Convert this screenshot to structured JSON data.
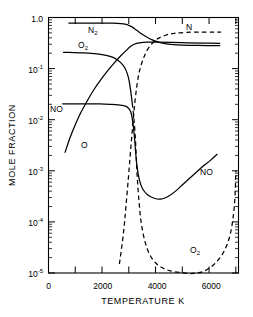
{
  "chart_data": {
    "type": "line",
    "title": "",
    "xlabel": "TEMPERATURE K",
    "ylabel": "MOLE FRACTION",
    "xlim": [
      0,
      7100
    ],
    "ylim": [
      1e-05,
      1.0
    ],
    "yscale": "log",
    "xscale": "linear",
    "grid": false,
    "legend": "inline-curve-labels",
    "xticks": [
      0,
      1000,
      2000,
      3000,
      4000,
      5000,
      6000,
      7000
    ],
    "xticklabels": [
      "0",
      "",
      "2000",
      "",
      "4000",
      "",
      "6000",
      ""
    ],
    "yticks": [
      1.0,
      0.1,
      0.01,
      0.001,
      0.0001,
      1e-05
    ],
    "yticklabels": [
      "1.0",
      "10-1",
      "10-2",
      "10-3",
      "10-4",
      "10-5"
    ],
    "series": [
      {
        "name": "N2",
        "label": "N2",
        "style": "solid",
        "label_x": 1450,
        "label_y": 0.55,
        "points": [
          [
            760,
            0.78
          ],
          [
            1200,
            0.78
          ],
          [
            1700,
            0.78
          ],
          [
            2100,
            0.778
          ],
          [
            2400,
            0.772
          ],
          [
            2700,
            0.757
          ],
          [
            2900,
            0.73
          ],
          [
            3000,
            0.7
          ],
          [
            3150,
            0.64
          ],
          [
            3300,
            0.56
          ],
          [
            3500,
            0.47
          ],
          [
            3700,
            0.405
          ],
          [
            3900,
            0.36
          ],
          [
            4100,
            0.33
          ],
          [
            4400,
            0.305
          ],
          [
            4800,
            0.292
          ],
          [
            5300,
            0.286
          ],
          [
            5900,
            0.283
          ],
          [
            6400,
            0.282
          ]
        ]
      },
      {
        "name": "N",
        "label": "N",
        "style": "dashed",
        "label_x": 5050,
        "label_y": 0.66,
        "points": [
          [
            2650,
            1.5e-05
          ],
          [
            2800,
            6e-05
          ],
          [
            2900,
            0.00022
          ],
          [
            3000,
            0.0009
          ],
          [
            3080,
            0.003
          ],
          [
            3150,
            0.008
          ],
          [
            3220,
            0.02
          ],
          [
            3300,
            0.045
          ],
          [
            3400,
            0.09
          ],
          [
            3550,
            0.16
          ],
          [
            3700,
            0.235
          ],
          [
            3900,
            0.32
          ],
          [
            4100,
            0.39
          ],
          [
            4400,
            0.455
          ],
          [
            4700,
            0.49
          ],
          [
            5100,
            0.51
          ],
          [
            5600,
            0.518
          ],
          [
            6100,
            0.52
          ],
          [
            6450,
            0.52
          ]
        ]
      },
      {
        "name": "O2",
        "label": "O2",
        "style": "solid-then-dashed",
        "label_x": 1300,
        "label_y": 0.29,
        "points": [
          [
            560,
            0.208
          ],
          [
            900,
            0.206
          ],
          [
            1300,
            0.203
          ],
          [
            1700,
            0.196
          ],
          [
            2000,
            0.188
          ],
          [
            2300,
            0.173
          ],
          [
            2500,
            0.157
          ],
          [
            2700,
            0.131
          ],
          [
            2850,
            0.104
          ],
          [
            2950,
            0.078
          ],
          [
            3020,
            0.055
          ],
          [
            3080,
            0.034
          ],
          [
            3130,
            0.021
          ],
          [
            3170,
            0.0135
          ],
          [
            3210,
            0.0082
          ],
          [
            3250,
            0.004
          ],
          [
            3280,
            0.0018
          ],
          [
            3320,
            0.0007
          ],
          [
            3380,
            0.00026
          ],
          [
            3460,
            0.0001
          ],
          [
            3600,
            4.2e-05
          ],
          [
            3800,
            2.2e-05
          ],
          [
            4100,
            1.42e-05
          ],
          [
            4500,
            1.12e-05
          ],
          [
            5000,
            1.01e-05
          ],
          [
            5400,
            9.8e-06
          ],
          [
            5800,
            1.08e-05
          ],
          [
            6200,
            1.5e-05
          ],
          [
            6550,
            2.6e-05
          ],
          [
            6800,
            6e-05
          ],
          [
            6950,
            0.00022
          ],
          [
            7000,
            0.001
          ]
        ]
      },
      {
        "name": "NO",
        "label": "NO",
        "style": "solid",
        "label_x": 600,
        "label_y": 0.021,
        "label2_x": 5450,
        "label2_y": 0.0015,
        "points": [
          [
            530,
            0.0205
          ],
          [
            900,
            0.0205
          ],
          [
            1400,
            0.0204
          ],
          [
            1900,
            0.0203
          ],
          [
            2300,
            0.02
          ],
          [
            2600,
            0.0196
          ],
          [
            2850,
            0.0186
          ],
          [
            2980,
            0.017
          ],
          [
            3060,
            0.0148
          ],
          [
            3110,
            0.012
          ],
          [
            3150,
            0.009
          ],
          [
            3190,
            0.006
          ],
          [
            3230,
            0.0035
          ],
          [
            3270,
            0.0019
          ],
          [
            3320,
            0.0011
          ],
          [
            3400,
            0.00065
          ],
          [
            3520,
            0.00044
          ],
          [
            3700,
            0.00034
          ],
          [
            3950,
            0.00029
          ],
          [
            4200,
            0.00028
          ],
          [
            4450,
            0.00031
          ],
          [
            4750,
            0.0004
          ],
          [
            5050,
            0.00056
          ],
          [
            5400,
            0.00082
          ],
          [
            5750,
            0.0012
          ],
          [
            6050,
            0.0016
          ],
          [
            6300,
            0.0021
          ]
        ]
      },
      {
        "name": "O",
        "label": "O",
        "style": "solid",
        "label_x": 1450,
        "label_y": 0.005,
        "points": [
          [
            620,
            0.0023
          ],
          [
            800,
            0.0044
          ],
          [
            1000,
            0.008
          ],
          [
            1200,
            0.0135
          ],
          [
            1450,
            0.0235
          ],
          [
            1700,
            0.039
          ],
          [
            1950,
            0.06
          ],
          [
            2200,
            0.089
          ],
          [
            2450,
            0.128
          ],
          [
            2700,
            0.178
          ],
          [
            2900,
            0.226
          ],
          [
            3050,
            0.268
          ],
          [
            3200,
            0.3
          ],
          [
            3400,
            0.32
          ],
          [
            3700,
            0.33
          ],
          [
            4100,
            0.33
          ],
          [
            4600,
            0.326
          ],
          [
            5200,
            0.32
          ],
          [
            5800,
            0.315
          ],
          [
            6400,
            0.312
          ]
        ]
      }
    ]
  },
  "labels": {
    "n2": "N",
    "n2_sub": "2",
    "n": "N",
    "o2": "O",
    "o2_sub": "2",
    "no": "NO",
    "o": "O",
    "no_right": "NO",
    "o2_right": "O",
    "o2_right_sub": "2"
  },
  "axes": {
    "y_title": "MOLE  FRACTION",
    "x_title": "TEMPERATURE  K",
    "y_labels": {
      "one": "1.0",
      "m1_base": "10",
      "m1_exp": "-1",
      "m2_base": "10",
      "m2_exp": "-2",
      "m3_base": "10",
      "m3_exp": "-3",
      "m4_base": "10",
      "m4_exp": "-4",
      "m5_base": "10",
      "m5_exp": "-5"
    },
    "x_labels": {
      "t0": "0",
      "t2000": "2000",
      "t4000": "4000",
      "t6000": "6000"
    }
  },
  "colors": {
    "ink": "#000000",
    "paper": "#ffffff"
  }
}
